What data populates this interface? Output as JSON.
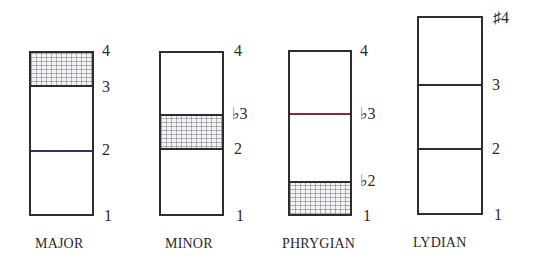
{
  "diagram": {
    "type": "scale-degree interval boxes",
    "columns": [
      {
        "mode": "MAJOR",
        "degrees": [
          "1",
          "2",
          "3",
          "4"
        ],
        "highlighted_interval": "3-4 (half step)",
        "labels": {
          "top": "4",
          "upper": "3",
          "middle": "2",
          "bottom": "1"
        }
      },
      {
        "mode": "MINOR",
        "degrees": [
          "1",
          "2",
          "♭3",
          "4"
        ],
        "highlighted_interval": "2-♭3 (half step)",
        "labels": {
          "top": "4",
          "upper": "♭3",
          "middle": "2",
          "bottom": "1"
        }
      },
      {
        "mode": "PHRYGIAN",
        "degrees": [
          "1",
          "♭2",
          "♭3",
          "4"
        ],
        "highlighted_interval": "1-♭2 (half step)",
        "labels": {
          "top": "4",
          "upper": "♭3",
          "middle": "♭2",
          "bottom": "1"
        }
      },
      {
        "mode": "LYDIAN",
        "degrees": [
          "1",
          "2",
          "3",
          "♯4"
        ],
        "highlighted_interval": "none",
        "labels": {
          "top": "♯4",
          "upper": "3",
          "middle": "2",
          "bottom": "1"
        }
      }
    ],
    "colors": {
      "outline": "#2e2e2e",
      "hatch": "#78788c",
      "major_line_2": "#2b3560",
      "phrygian_line_b3": "#8a2a2a"
    }
  }
}
